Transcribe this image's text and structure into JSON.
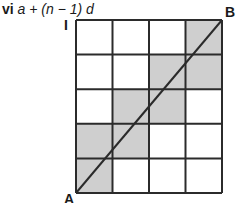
{
  "diagram": {
    "title": {
      "numeral": "vi",
      "expression": "a + (n − 1) d"
    },
    "labels": {
      "row_marker": "I",
      "start_corner": "A",
      "end_corner": "B"
    },
    "grid": {
      "columns": 4,
      "rows": 5,
      "shaded_cells_from_bottom": [
        {
          "row": 1,
          "cols": [
            1
          ]
        },
        {
          "row": 2,
          "cols": [
            1,
            2
          ]
        },
        {
          "row": 3,
          "cols": [
            2,
            3
          ]
        },
        {
          "row": 4,
          "cols": [
            3,
            4
          ]
        },
        {
          "row": 5,
          "cols": [
            4
          ]
        }
      ],
      "diagonal": "A (bottom-left) to B (top-right)"
    },
    "colors": {
      "line": "#2b2b2b",
      "shade": "#cfcfcf",
      "background": "#ffffff"
    }
  }
}
